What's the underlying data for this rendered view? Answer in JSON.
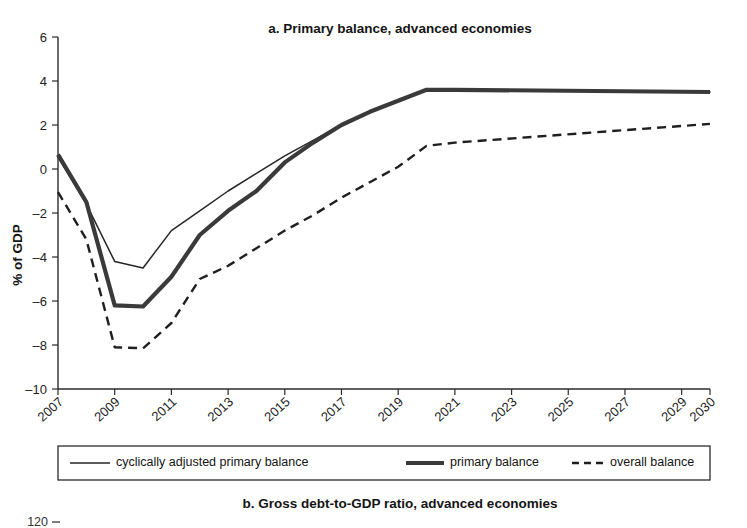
{
  "figure": {
    "panel_a_title": "a. Primary balance, advanced economies",
    "panel_b_title": "b. Gross debt-to-GDP ratio, advanced economies",
    "y_axis_title": "% of GDP",
    "panel_b_first_tick": "120"
  },
  "legend": {
    "items": [
      {
        "label": "cyclically adjusted primary balance",
        "style": "thin-solid"
      },
      {
        "label": "primary balance",
        "style": "thick-solid"
      },
      {
        "label": "overall balance",
        "style": "dashed"
      }
    ]
  },
  "chart_data": {
    "type": "line",
    "title": "a. Primary balance, advanced economies",
    "xlabel": "",
    "ylabel": "% of GDP",
    "ylim": [
      -10,
      6
    ],
    "yticks": [
      6,
      4,
      2,
      0,
      -2,
      -4,
      -6,
      -8,
      -10
    ],
    "ytick_labels": [
      "6",
      "4",
      "2",
      "0",
      "-2",
      "-4",
      "-6",
      "-8",
      "-10"
    ],
    "xlim": [
      2007,
      2030
    ],
    "xticks": [
      2007,
      2009,
      2011,
      2013,
      2015,
      2017,
      2019,
      2021,
      2023,
      2025,
      2027,
      2029,
      2030
    ],
    "xtick_labels": [
      "2007",
      "2009",
      "2011",
      "2013",
      "2015",
      "2017",
      "2019",
      "2021",
      "2023",
      "2025",
      "2027",
      "2029",
      "2030"
    ],
    "grid": false,
    "legend_position": "below-axes",
    "x": [
      2007,
      2008,
      2009,
      2010,
      2011,
      2012,
      2013,
      2014,
      2015,
      2016,
      2017,
      2018,
      2019,
      2020,
      2021,
      2030
    ],
    "series": [
      {
        "name": "cyclically adjusted primary balance",
        "style": "thin-solid",
        "values": [
          0.55,
          -1.6,
          -4.2,
          -4.5,
          -2.8,
          -1.9,
          -1.0,
          -0.2,
          0.6,
          1.3,
          2.0,
          2.6,
          3.1,
          3.6,
          3.6,
          3.5
        ]
      },
      {
        "name": "primary balance",
        "style": "thick-solid",
        "values": [
          0.65,
          -1.5,
          -6.2,
          -6.25,
          -4.9,
          -3.0,
          -1.9,
          -1.0,
          0.3,
          1.2,
          2.0,
          2.6,
          3.1,
          3.6,
          3.6,
          3.5
        ]
      },
      {
        "name": "overall balance",
        "style": "dashed",
        "values": [
          -1.05,
          -3.2,
          -8.1,
          -8.15,
          -7.0,
          -5.0,
          -4.4,
          -3.6,
          -2.8,
          -2.1,
          -1.3,
          -0.6,
          0.1,
          1.05,
          1.2,
          2.05
        ]
      }
    ]
  }
}
